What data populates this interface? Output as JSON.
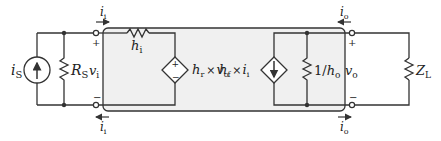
{
  "diagram": {
    "type": "circuit",
    "colors": {
      "wire": "#333333",
      "box_fill": "#f0f0f0",
      "box_stroke": "#333333",
      "background": "#ffffff"
    },
    "source": {
      "current_source": {
        "symbol": "i",
        "sub": "S"
      },
      "resistor": {
        "symbol": "R",
        "sub": "S"
      }
    },
    "input_port": {
      "voltage": {
        "symbol": "v",
        "sub": "i"
      },
      "plus": "+",
      "minus": "−",
      "current_top": {
        "symbol": "i",
        "sub": "i"
      },
      "current_bottom": {
        "symbol": "i",
        "sub": "i"
      }
    },
    "two_port": {
      "input_resistance": {
        "symbol": "h",
        "sub": "i"
      },
      "vcvs": {
        "label_h": "h",
        "label_h_sub": "r",
        "times": "×",
        "label_v": "v",
        "label_v_sub": "o",
        "plus": "+",
        "minus": "−"
      },
      "cccs": {
        "label_h": "h",
        "label_h_sub": "f",
        "times": "×",
        "label_i": "i",
        "label_i_sub": "i"
      },
      "output_conductance": {
        "prefix": "1/",
        "symbol": "h",
        "sub": "o"
      }
    },
    "output_port": {
      "voltage": {
        "symbol": "v",
        "sub": "o"
      },
      "plus": "+",
      "minus": "−",
      "current_top": {
        "symbol": "i",
        "sub": "o"
      },
      "current_bottom": {
        "symbol": "i",
        "sub": "o"
      }
    },
    "load": {
      "symbol": "Z",
      "sub": "L"
    }
  }
}
